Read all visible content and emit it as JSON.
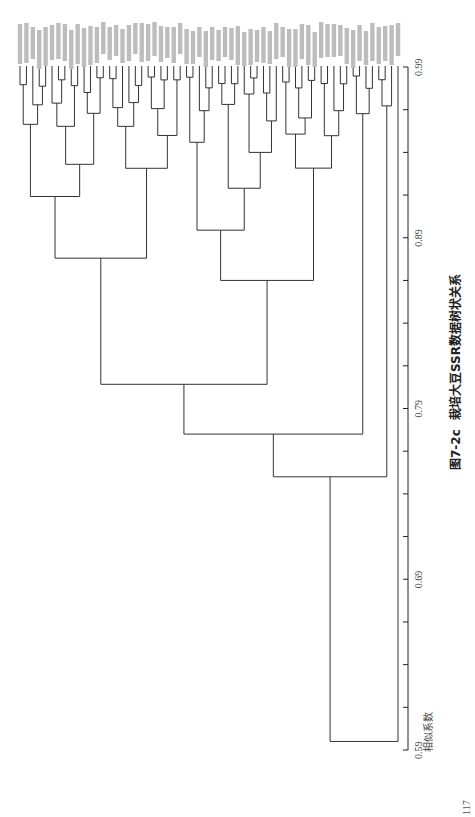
{
  "figure": {
    "caption_number": "图7-2c",
    "caption_title": "栽培大豆SSR数据树状关系",
    "axis_title": "相似系数",
    "axis_ticks": [
      "0.59",
      "0.69",
      "0.79",
      "0.89",
      "0.99"
    ],
    "page_number": "117"
  },
  "chart_data": {
    "type": "dendrogram",
    "title": "图7-2c 栽培大豆SSR数据树状关系",
    "orientation": "rotated-90 (leaves at top, similarity axis along right edge, root at bottom)",
    "axis_label": "相似系数",
    "axis_range": [
      0.59,
      0.99
    ],
    "axis_major_ticks": [
      0.59,
      0.69,
      0.79,
      0.89,
      0.99
    ],
    "minor_tick_step": 0.025,
    "leaf_count_estimate": 60,
    "leaf_labels_legible": false,
    "major_clusters": [
      {
        "name": "main-cluster",
        "leaves": "approx. 1-52",
        "join_similarity": 0.77
      },
      {
        "name": "cluster-b",
        "leaves": "approx. 53-56",
        "join_similarity": 0.8
      },
      {
        "name": "cluster-c",
        "leaves": "approx. 57-59",
        "join_similarity": 0.76
      },
      {
        "name": "outlier",
        "leaves": "approx. 60",
        "join_similarity": 0.6
      }
    ],
    "root_similarity": 0.6
  }
}
